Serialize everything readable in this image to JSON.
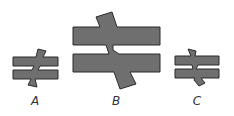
{
  "figures": [
    {
      "id": "A",
      "label": "A",
      "label_x": 35,
      "label_y": 94
    },
    {
      "id": "B",
      "label": "B",
      "label_x": 116,
      "label_y": 94
    },
    {
      "id": "C",
      "label": "C",
      "label_x": 197,
      "label_y": 94
    }
  ],
  "colors": {
    "fill": "#6f6f6f",
    "stroke": "#2a2a2a",
    "background": "#ffffff"
  }
}
